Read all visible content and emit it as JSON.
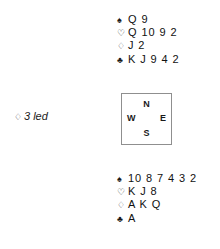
{
  "diagram": {
    "type": "bridge-hand-deal",
    "suit_symbols": {
      "spade": "♠",
      "heart": "♡",
      "diamond": "♢",
      "club": "♣"
    },
    "north": {
      "label": "North hand",
      "suits": [
        {
          "name": "spades",
          "symbol": "♠",
          "cards": "Q 9"
        },
        {
          "name": "hearts",
          "symbol": "♡",
          "cards": "Q 10 9 2"
        },
        {
          "name": "diamonds",
          "symbol": "♢",
          "cards": "J 2"
        },
        {
          "name": "clubs",
          "symbol": "♣",
          "cards": "K J 9 4 2"
        }
      ]
    },
    "south": {
      "label": "South hand",
      "suits": [
        {
          "name": "spades",
          "symbol": "♠",
          "cards": "10 8 7 4 3 2"
        },
        {
          "name": "hearts",
          "symbol": "♡",
          "cards": "K J 8"
        },
        {
          "name": "diamonds",
          "symbol": "♢",
          "cards": "A K Q"
        },
        {
          "name": "clubs",
          "symbol": "♣",
          "cards": "A"
        }
      ]
    },
    "compass": {
      "north": "N",
      "west": "W",
      "east": "E",
      "south": "S"
    },
    "lead": {
      "suit_symbol": "♢",
      "text": "3 led"
    },
    "colors": {
      "text": "#1a1a1a",
      "box_border": "#8f8f8f",
      "background": "#ffffff"
    }
  }
}
